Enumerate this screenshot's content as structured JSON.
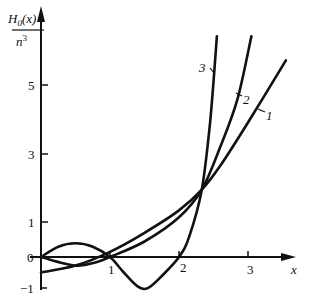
{
  "chart_data": {
    "type": "line",
    "title": "",
    "ylabel_numerator": "H0(x)",
    "ylabel_numerator_base": "H",
    "ylabel_numerator_sub": "0",
    "ylabel_numerator_arg": "(x)",
    "ylabel_denominator": "n³",
    "ylabel_denominator_base": "n",
    "ylabel_denominator_sup": "3",
    "xlabel": "x",
    "x_ticks": [
      "1",
      "2",
      "3"
    ],
    "y_ticks": [
      "5",
      "3",
      "1",
      "0",
      "−1"
    ],
    "xlim": [
      0,
      3.6
    ],
    "ylim": [
      -1,
      6.4
    ],
    "grid": false,
    "legend": "inline curve labels",
    "series": [
      {
        "name": "1",
        "x": [
          0,
          0.5,
          1.0,
          1.5,
          2.0,
          2.33,
          2.6,
          3.0,
          3.55
        ],
        "y": [
          -0.45,
          -0.25,
          0.15,
          0.7,
          1.35,
          1.95,
          2.65,
          3.9,
          5.7
        ]
      },
      {
        "name": "2",
        "x": [
          0,
          0.5,
          0.8,
          1.0,
          1.5,
          2.0,
          2.33,
          2.6,
          2.85,
          3.05
        ],
        "y": [
          0,
          -0.25,
          -0.15,
          0.0,
          0.45,
          1.15,
          1.95,
          3.2,
          4.6,
          6.4
        ]
      },
      {
        "name": "3",
        "x": [
          0,
          0.25,
          0.5,
          0.75,
          1.0,
          1.2,
          1.4,
          1.55,
          1.75,
          2.0,
          2.15,
          2.33,
          2.45,
          2.55
        ],
        "y": [
          0,
          0.3,
          0.4,
          0.3,
          0.0,
          -0.45,
          -0.85,
          -0.9,
          -0.55,
          0.0,
          0.6,
          1.95,
          3.9,
          6.4
        ]
      }
    ],
    "annotations": [
      {
        "text": "1",
        "curve": "1"
      },
      {
        "text": "2",
        "curve": "2"
      },
      {
        "text": "3",
        "curve": "3"
      }
    ]
  }
}
